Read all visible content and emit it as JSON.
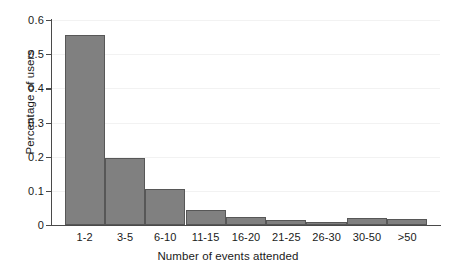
{
  "chart_data": {
    "type": "bar",
    "title": "",
    "subtitle": "",
    "xlabel": "Number of events attended",
    "ylabel": "Percentage of users",
    "categories": [
      "1-2",
      "3-5",
      "6-10",
      "11-15",
      "16-20",
      "21-25",
      "26-30",
      "30-50",
      ">50"
    ],
    "values": [
      0.557,
      0.196,
      0.105,
      0.045,
      0.024,
      0.014,
      0.009,
      0.021,
      0.017
    ],
    "ylim": [
      0,
      0.6
    ],
    "ytick_labels": [
      "0",
      "0.1",
      "0.2",
      "0.3",
      "0.4",
      "0.5",
      "0.6"
    ],
    "ytick_values": [
      0,
      0.1,
      0.2,
      0.3,
      0.4,
      0.5,
      0.6
    ],
    "grid": true,
    "legend": "none",
    "bar_fill_color": "#808080",
    "bar_edge_color": "#575757",
    "axis_color": "#4a4a4a",
    "background_color": "#ffffff"
  }
}
